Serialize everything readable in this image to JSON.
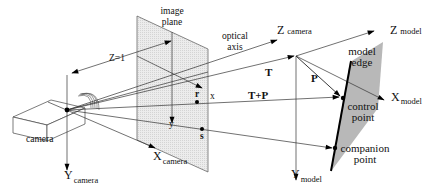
{
  "diagram": {
    "type": "camera perspective projection / model pose geometry",
    "labels": {
      "image_plane_line1": "image",
      "image_plane_line2": "plane",
      "optical_axis_line1": "optical",
      "optical_axis_line2": "axis",
      "z_eq_1": "Z=1",
      "z_camera_main": "Z",
      "z_camera_sub": "camera",
      "z_model_main": "Z",
      "z_model_sub": "model",
      "x_model_main": "X",
      "x_model_sub": "model",
      "y_model_main": "Y",
      "y_model_sub": "model",
      "x_camera_main": "X",
      "x_camera_sub": "camera",
      "y_camera_main": "Y",
      "y_camera_sub": "camera",
      "camera": "camera",
      "model_edge_line1": "model",
      "model_edge_line2": "edge",
      "control_point_line1": "control",
      "control_point_line2": "point",
      "companion_point_line1": "companion",
      "companion_point_line2": "point",
      "vector_T": "T",
      "vector_P": "P",
      "vector_T_plus_P": "T+P",
      "image_x": "x",
      "image_y": "y",
      "point_r": "r",
      "point_s": "s"
    },
    "colors": {
      "image_plane_fill": "#e6e6e6",
      "model_plane_fill": "#b8b8b8",
      "line": "#333333"
    }
  }
}
